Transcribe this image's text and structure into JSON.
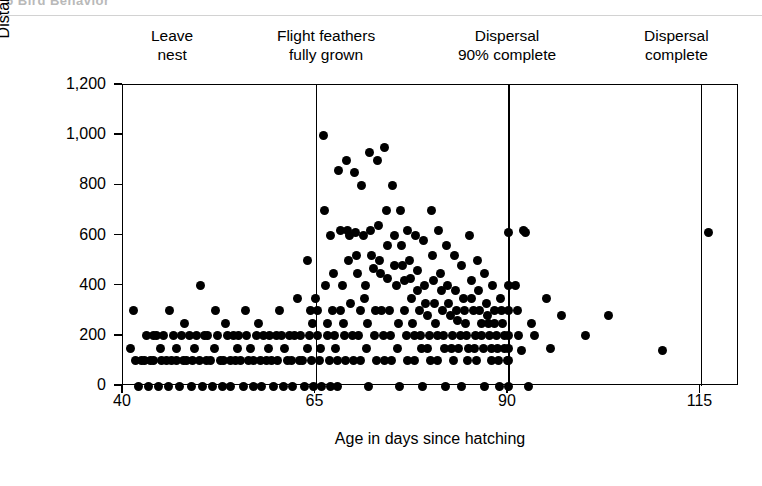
{
  "page_header": {
    "text": "6   Bird Behavior"
  },
  "chart_data": {
    "type": "scatter",
    "title": "",
    "xlabel": "Age in days since hatching",
    "ylabel": "Distance from nest (m)",
    "xlim": [
      40,
      120
    ],
    "ylim": [
      0,
      1200
    ],
    "xticks": [
      40,
      65,
      90,
      115
    ],
    "xtick_labels": [
      "40",
      "65",
      "90",
      "115"
    ],
    "yticks": [
      0,
      200,
      400,
      600,
      800,
      1000,
      1200
    ],
    "ytick_labels": [
      "0",
      "200",
      "400",
      "600",
      "800",
      "1,000",
      "1,200"
    ],
    "grid": false,
    "legend": "none",
    "marker": "filled-circle",
    "marker_color": "#000000",
    "annotations": [
      {
        "name": "leave-nest",
        "text": "Leave\nnest",
        "x": 46.5,
        "line_x": null
      },
      {
        "name": "flight-feathers-fully-grown",
        "text": "Flight feathers\nfully grown",
        "x": 66.5,
        "line_x": 65
      },
      {
        "name": "dispersal-90-complete",
        "text": "Dispersal\n90% complete",
        "x": 90.0,
        "line_x": 90
      },
      {
        "name": "dispersal-complete",
        "text": "Dispersal\ncomplete",
        "x": 112.0,
        "line_x": 115
      }
    ],
    "reference_lines": [
      65,
      90,
      115
    ],
    "points": [
      [
        41,
        150
      ],
      [
        41.3,
        300
      ],
      [
        41.6,
        100
      ],
      [
        42,
        0
      ],
      [
        42.4,
        100
      ],
      [
        42.8,
        100
      ],
      [
        43,
        200
      ],
      [
        43.3,
        0
      ],
      [
        43.6,
        100
      ],
      [
        43.9,
        200
      ],
      [
        44,
        100
      ],
      [
        44.3,
        200
      ],
      [
        44.6,
        0
      ],
      [
        44.9,
        150
      ],
      [
        45,
        100
      ],
      [
        45.3,
        200
      ],
      [
        45.6,
        100
      ],
      [
        45.9,
        0
      ],
      [
        46,
        300
      ],
      [
        46.3,
        100
      ],
      [
        46.6,
        200
      ],
      [
        46.9,
        150
      ],
      [
        47,
        100
      ],
      [
        47.3,
        0
      ],
      [
        47.6,
        200
      ],
      [
        47.9,
        100
      ],
      [
        48,
        250
      ],
      [
        48.3,
        100
      ],
      [
        48.6,
        200
      ],
      [
        48.9,
        0
      ],
      [
        49,
        100
      ],
      [
        49.3,
        150
      ],
      [
        49.6,
        200
      ],
      [
        49.9,
        100
      ],
      [
        50,
        400
      ],
      [
        50.3,
        0
      ],
      [
        50.6,
        200
      ],
      [
        50.9,
        100
      ],
      [
        51,
        200
      ],
      [
        51.3,
        100
      ],
      [
        51.6,
        0
      ],
      [
        51.9,
        150
      ],
      [
        52,
        300
      ],
      [
        52.3,
        200
      ],
      [
        52.6,
        100
      ],
      [
        52.9,
        0
      ],
      [
        53,
        100
      ],
      [
        53.3,
        250
      ],
      [
        53.6,
        200
      ],
      [
        53.9,
        100
      ],
      [
        54,
        0
      ],
      [
        54.3,
        200
      ],
      [
        54.6,
        100
      ],
      [
        54.9,
        150
      ],
      [
        55,
        200
      ],
      [
        55.3,
        100
      ],
      [
        55.6,
        0
      ],
      [
        55.9,
        300
      ],
      [
        56,
        200
      ],
      [
        56.3,
        100
      ],
      [
        56.6,
        150
      ],
      [
        56.9,
        0
      ],
      [
        57,
        100
      ],
      [
        57.3,
        200
      ],
      [
        57.6,
        250
      ],
      [
        57.9,
        100
      ],
      [
        58,
        0
      ],
      [
        58.3,
        200
      ],
      [
        58.6,
        100
      ],
      [
        58.9,
        150
      ],
      [
        59,
        200
      ],
      [
        59.3,
        100
      ],
      [
        59.6,
        0
      ],
      [
        59.9,
        200
      ],
      [
        60,
        100
      ],
      [
        60.3,
        300
      ],
      [
        60.6,
        200
      ],
      [
        60.9,
        0
      ],
      [
        61,
        150
      ],
      [
        61.3,
        100
      ],
      [
        61.6,
        200
      ],
      [
        61.9,
        100
      ],
      [
        62,
        0
      ],
      [
        62.3,
        200
      ],
      [
        62.6,
        350
      ],
      [
        62.9,
        100
      ],
      [
        63,
        200
      ],
      [
        63.3,
        100
      ],
      [
        63.6,
        0
      ],
      [
        63.9,
        150
      ],
      [
        64,
        500
      ],
      [
        64.2,
        200
      ],
      [
        64.5,
        100
      ],
      [
        64.8,
        0
      ],
      [
        64.3,
        300
      ],
      [
        64.6,
        250
      ],
      [
        65,
        350
      ],
      [
        65.2,
        200
      ],
      [
        65.5,
        100
      ],
      [
        65.8,
        0
      ],
      [
        65.3,
        300
      ],
      [
        65.6,
        150
      ],
      [
        66,
        1000
      ],
      [
        66.2,
        700
      ],
      [
        66.5,
        250
      ],
      [
        66.8,
        100
      ],
      [
        66.3,
        400
      ],
      [
        66.6,
        200
      ],
      [
        66.9,
        0
      ],
      [
        67,
        600
      ],
      [
        67.2,
        300
      ],
      [
        67.5,
        200
      ],
      [
        67.8,
        100
      ],
      [
        67.3,
        450
      ],
      [
        67.6,
        150
      ],
      [
        67.9,
        0
      ],
      [
        68,
        860
      ],
      [
        68.2,
        620
      ],
      [
        68.5,
        400
      ],
      [
        68.8,
        200
      ],
      [
        68.3,
        300
      ],
      [
        68.6,
        250
      ],
      [
        68.9,
        100
      ],
      [
        69,
        900
      ],
      [
        69.2,
        620
      ],
      [
        69.4,
        600
      ],
      [
        69.6,
        330
      ],
      [
        69.3,
        500
      ],
      [
        69.8,
        200
      ],
      [
        69.9,
        100
      ],
      [
        70,
        850
      ],
      [
        70.2,
        610
      ],
      [
        70.5,
        450
      ],
      [
        70.8,
        300
      ],
      [
        70.3,
        520
      ],
      [
        70.6,
        200
      ],
      [
        70.9,
        100
      ],
      [
        71,
        800
      ],
      [
        71.2,
        600
      ],
      [
        71.5,
        400
      ],
      [
        71.8,
        250
      ],
      [
        71.3,
        350
      ],
      [
        71.6,
        150
      ],
      [
        71.9,
        0
      ],
      [
        72,
        930
      ],
      [
        72.2,
        620
      ],
      [
        72.5,
        470
      ],
      [
        72.8,
        300
      ],
      [
        72.3,
        520
      ],
      [
        72.6,
        200
      ],
      [
        72.9,
        100
      ],
      [
        73,
        900
      ],
      [
        73.2,
        640
      ],
      [
        73.5,
        450
      ],
      [
        73.8,
        200
      ],
      [
        73.3,
        500
      ],
      [
        73.6,
        300
      ],
      [
        73.9,
        100
      ],
      [
        74,
        950
      ],
      [
        74.2,
        700
      ],
      [
        74.4,
        430
      ],
      [
        74.6,
        300
      ],
      [
        74.3,
        560
      ],
      [
        74.8,
        200
      ],
      [
        74.9,
        100
      ],
      [
        75,
        800
      ],
      [
        75.2,
        600
      ],
      [
        75.5,
        400
      ],
      [
        75.8,
        250
      ],
      [
        75.3,
        480
      ],
      [
        75.6,
        150
      ],
      [
        75.9,
        0
      ],
      [
        76,
        700
      ],
      [
        76.2,
        560
      ],
      [
        76.5,
        420
      ],
      [
        76.8,
        200
      ],
      [
        76.3,
        480
      ],
      [
        76.6,
        300
      ],
      [
        76.9,
        100
      ],
      [
        77,
        620
      ],
      [
        77.2,
        500
      ],
      [
        77.5,
        350
      ],
      [
        77.8,
        200
      ],
      [
        77.3,
        430
      ],
      [
        77.6,
        250
      ],
      [
        77.9,
        100
      ],
      [
        78,
        600
      ],
      [
        78.2,
        460
      ],
      [
        78.5,
        300
      ],
      [
        78.8,
        150
      ],
      [
        78.3,
        380
      ],
      [
        78.6,
        200
      ],
      [
        78.9,
        0
      ],
      [
        79,
        580
      ],
      [
        79.2,
        400
      ],
      [
        79.5,
        280
      ],
      [
        79.8,
        200
      ],
      [
        79.3,
        330
      ],
      [
        79.6,
        150
      ],
      [
        79.9,
        100
      ],
      [
        80,
        700
      ],
      [
        80.2,
        520
      ],
      [
        80.5,
        330
      ],
      [
        80.8,
        200
      ],
      [
        80.3,
        420
      ],
      [
        80.6,
        250
      ],
      [
        80.9,
        100
      ],
      [
        81,
        620
      ],
      [
        81.2,
        450
      ],
      [
        81.5,
        300
      ],
      [
        81.8,
        150
      ],
      [
        81.3,
        380
      ],
      [
        81.6,
        200
      ],
      [
        81.9,
        0
      ],
      [
        82,
        560
      ],
      [
        82.2,
        400
      ],
      [
        82.5,
        280
      ],
      [
        82.8,
        200
      ],
      [
        82.3,
        330
      ],
      [
        82.6,
        150
      ],
      [
        82.9,
        100
      ],
      [
        83,
        520
      ],
      [
        83.2,
        380
      ],
      [
        83.5,
        260
      ],
      [
        83.8,
        200
      ],
      [
        83.3,
        300
      ],
      [
        83.6,
        150
      ],
      [
        83.9,
        0
      ],
      [
        84,
        480
      ],
      [
        84.2,
        350
      ],
      [
        84.5,
        250
      ],
      [
        84.8,
        100
      ],
      [
        84.3,
        300
      ],
      [
        84.6,
        200
      ],
      [
        84.9,
        150
      ],
      [
        85,
        600
      ],
      [
        85.2,
        420
      ],
      [
        85.5,
        300
      ],
      [
        85.8,
        200
      ],
      [
        85.3,
        350
      ],
      [
        85.6,
        150
      ],
      [
        85.9,
        100
      ],
      [
        86,
        500
      ],
      [
        86.2,
        380
      ],
      [
        86.5,
        250
      ],
      [
        86.8,
        150
      ],
      [
        86.3,
        300
      ],
      [
        86.6,
        200
      ],
      [
        86.9,
        0
      ],
      [
        87,
        450
      ],
      [
        87.2,
        330
      ],
      [
        87.5,
        250
      ],
      [
        87.8,
        100
      ],
      [
        87.3,
        280
      ],
      [
        87.6,
        200
      ],
      [
        87.9,
        150
      ],
      [
        88,
        400
      ],
      [
        88.2,
        300
      ],
      [
        88.5,
        200
      ],
      [
        88.8,
        100
      ],
      [
        88.3,
        250
      ],
      [
        88.6,
        150
      ],
      [
        88.9,
        0
      ],
      [
        89,
        350
      ],
      [
        89.3,
        250
      ],
      [
        89.6,
        200
      ],
      [
        89.9,
        100
      ],
      [
        89.2,
        300
      ],
      [
        89.5,
        150
      ],
      [
        90,
        610
      ],
      [
        90,
        400
      ],
      [
        90,
        300
      ],
      [
        90,
        200
      ],
      [
        90,
        150
      ],
      [
        90,
        100
      ],
      [
        90,
        0
      ],
      [
        91,
        400
      ],
      [
        91.4,
        200
      ],
      [
        91.7,
        140
      ],
      [
        91.2,
        300
      ],
      [
        92,
        620
      ],
      [
        92.3,
        610
      ],
      [
        92.6,
        0
      ],
      [
        93,
        250
      ],
      [
        93.5,
        200
      ],
      [
        95,
        350
      ],
      [
        95.5,
        150
      ],
      [
        97,
        280
      ],
      [
        100,
        200
      ],
      [
        103,
        280
      ],
      [
        110,
        140
      ],
      [
        116,
        610
      ]
    ]
  }
}
